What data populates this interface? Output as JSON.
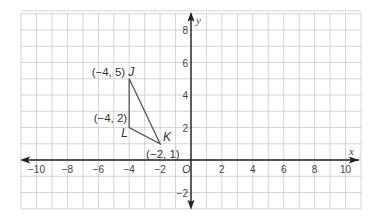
{
  "diagram": {
    "type": "coordinate-plane",
    "x_axis": {
      "name": "x",
      "range": [
        -11,
        11
      ],
      "tick_labels": [
        "−10",
        "−8",
        "−6",
        "−4",
        "−2",
        "2",
        "4",
        "6",
        "8",
        "10"
      ],
      "tick_values": [
        -10,
        -8,
        -6,
        -4,
        -2,
        2,
        4,
        6,
        8,
        10
      ]
    },
    "y_axis": {
      "name": "y",
      "range": [
        -3,
        9
      ],
      "tick_labels": [
        "8",
        "6",
        "4",
        "2",
        "−2"
      ],
      "tick_values": [
        8,
        6,
        4,
        2,
        -2
      ]
    },
    "origin_label": "O",
    "triangle": {
      "vertices": [
        {
          "name": "J",
          "x": -4,
          "y": 5,
          "coord_label": "(−4, 5)"
        },
        {
          "name": "K",
          "x": -2,
          "y": 1,
          "coord_label": "(−2, 1)"
        },
        {
          "name": "L",
          "x": -4,
          "y": 2,
          "coord_label": "(−4, 2)"
        }
      ]
    },
    "colors": {
      "grid": "#c9c9c9",
      "axis": "#222222",
      "triangle": "#555555",
      "text": "#333333"
    }
  }
}
